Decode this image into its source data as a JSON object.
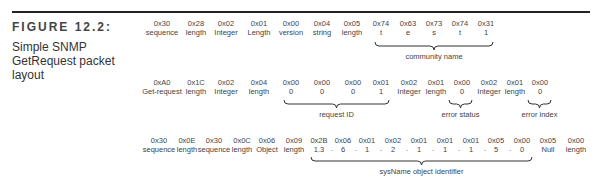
{
  "figure": {
    "number": "FIGURE 12.2:",
    "caption": "Simple SNMP GetRequest packet layout"
  },
  "rows": [
    {
      "top": 19,
      "cells": [
        {
          "x": 162,
          "hex": "0x30",
          "label": "sequence"
        },
        {
          "x": 196,
          "hex": "0x28",
          "label": "length"
        },
        {
          "x": 226,
          "hex": "0x02",
          "label": "Integer"
        },
        {
          "x": 259,
          "hex": "0x01",
          "label": "Length"
        },
        {
          "x": 291,
          "hex": "0x00",
          "label": "version"
        },
        {
          "x": 322,
          "hex": "0x04",
          "label": "string"
        },
        {
          "x": 352,
          "hex": "0x05",
          "label": "length"
        },
        {
          "x": 381,
          "hex": "0x74",
          "label": "t"
        },
        {
          "x": 408,
          "hex": "0x63",
          "label": "e"
        },
        {
          "x": 434,
          "hex": "0x73",
          "label": "s"
        },
        {
          "x": 460,
          "hex": "0x74",
          "label": "t"
        },
        {
          "x": 486,
          "hex": "0x31",
          "label": "1"
        }
      ],
      "braces": [
        {
          "x1": 374,
          "x2": 494,
          "top": 42,
          "label": "community name"
        }
      ]
    },
    {
      "top": 78,
      "cells": [
        {
          "x": 162,
          "hex": "0xA0",
          "label": "Get-request"
        },
        {
          "x": 196,
          "hex": "0x1C",
          "label": "length"
        },
        {
          "x": 226,
          "hex": "0x02",
          "label": "Integer"
        },
        {
          "x": 259,
          "hex": "0x04",
          "label": "length"
        },
        {
          "x": 291,
          "hex": "0x00",
          "label": "0"
        },
        {
          "x": 322,
          "hex": "0x00",
          "label": "0"
        },
        {
          "x": 353,
          "hex": "0x00",
          "label": "0"
        },
        {
          "x": 381,
          "hex": "0x01",
          "label": "1"
        },
        {
          "x": 409,
          "hex": "0x02",
          "label": "Integer"
        },
        {
          "x": 436,
          "hex": "0x01",
          "label": "length"
        },
        {
          "x": 462,
          "hex": "0x00",
          "label": "0"
        },
        {
          "x": 489,
          "hex": "0x02",
          "label": "Integer"
        },
        {
          "x": 515,
          "hex": "0x01",
          "label": "length"
        },
        {
          "x": 540,
          "hex": "0x00",
          "label": "0"
        }
      ],
      "braces": [
        {
          "x1": 283,
          "x2": 390,
          "top": 100,
          "label": "request ID"
        },
        {
          "x1": 448,
          "x2": 473,
          "top": 100,
          "label": "error status"
        },
        {
          "x1": 527,
          "x2": 552,
          "top": 100,
          "label": "error index"
        }
      ]
    },
    {
      "top": 136,
      "cells": [
        {
          "x": 159,
          "hex": "0x30",
          "label": "sequence"
        },
        {
          "x": 187,
          "hex": "0x0E",
          "label": "length"
        },
        {
          "x": 214,
          "hex": "0x30",
          "label": "sequence"
        },
        {
          "x": 242,
          "hex": "0x0C",
          "label": "length"
        },
        {
          "x": 267,
          "hex": "0x06",
          "label": "Object"
        },
        {
          "x": 294,
          "hex": "0x09",
          "label": "length"
        },
        {
          "x": 319,
          "hex": "0x2B",
          "label": "1.3"
        },
        {
          "x": 343,
          "hex": "0x06",
          "label": "6"
        },
        {
          "x": 367,
          "hex": "0x01",
          "label": "1"
        },
        {
          "x": 393,
          "hex": "0x02",
          "label": "2"
        },
        {
          "x": 419,
          "hex": "0x01",
          "label": "1"
        },
        {
          "x": 445,
          "hex": "0x01",
          "label": "1"
        },
        {
          "x": 471,
          "hex": "0x01",
          "label": "1"
        },
        {
          "x": 496,
          "hex": "0x05",
          "label": "5"
        },
        {
          "x": 522,
          "hex": "0x00",
          "label": "0"
        },
        {
          "x": 548,
          "hex": "0x05",
          "label": "Null"
        },
        {
          "x": 576,
          "hex": "0x00",
          "label": "length"
        }
      ],
      "dots_between": [
        331,
        355,
        380,
        406,
        432,
        458,
        484,
        509
      ],
      "braces": [
        {
          "x1": 310,
          "x2": 533,
          "top": 157,
          "label": "sysName object identifier"
        }
      ]
    }
  ]
}
